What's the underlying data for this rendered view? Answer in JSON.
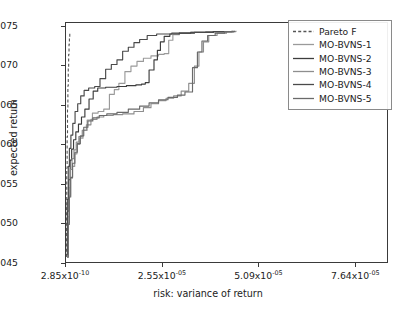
{
  "chart_data": {
    "type": "line",
    "title": "",
    "xlabel": "risk: variance of return",
    "ylabel": "expected return",
    "xlim": [
      0,
      8.5e-05
    ],
    "ylim": [
      0.045,
      0.0755
    ],
    "grid": false,
    "legend_position": "upper right",
    "xticks": [
      {
        "value": 2.85e-10,
        "mantissa": "2.85x10",
        "exponent": "-10",
        "label": "2.85x10-10"
      },
      {
        "value": 2.55e-05,
        "mantissa": "2.55x10",
        "exponent": "-05",
        "label": "2.55x10-05"
      },
      {
        "value": 5.09e-05,
        "mantissa": "5.09x10",
        "exponent": "-05",
        "label": "5.09x10-05"
      },
      {
        "value": 7.64e-05,
        "mantissa": "7.64x10",
        "exponent": "-05",
        "label": "7.64x10-05"
      }
    ],
    "yticks": [
      {
        "value": 0.045,
        "label": "0.045"
      },
      {
        "value": 0.05,
        "label": "0.050"
      },
      {
        "value": 0.055,
        "label": "0.055"
      },
      {
        "value": 0.06,
        "label": "0.060"
      },
      {
        "value": 0.065,
        "label": "0.065"
      },
      {
        "value": 0.07,
        "label": "0.070"
      },
      {
        "value": 0.075,
        "label": "0.075"
      }
    ],
    "series": [
      {
        "name": "Pareto F",
        "color": "#555555",
        "style": "dashed",
        "width": 1.1,
        "points": [
          [
            0.0,
            0.0457
          ],
          [
            1e-07,
            0.052
          ],
          [
            2e-07,
            0.057
          ],
          [
            3e-07,
            0.061
          ],
          [
            4e-07,
            0.0645
          ],
          [
            5e-07,
            0.0675
          ],
          [
            6e-07,
            0.0698
          ],
          [
            7e-07,
            0.0715
          ],
          [
            8e-07,
            0.0728
          ],
          [
            9e-07,
            0.0737
          ],
          [
            1e-06,
            0.0742
          ]
        ]
      },
      {
        "name": "MO-BVNS-1",
        "color": "#9a9a9a",
        "style": "solid",
        "width": 1.15,
        "points": [
          [
            3e-07,
            0.0456
          ],
          [
            6e-07,
            0.05
          ],
          [
            9e-07,
            0.0535
          ],
          [
            1.2e-06,
            0.0557
          ],
          [
            1.7e-06,
            0.0572
          ],
          [
            2.3e-06,
            0.0588
          ],
          [
            2.9e-06,
            0.06
          ],
          [
            3.6e-06,
            0.0608
          ],
          [
            4.5e-06,
            0.0618
          ],
          [
            5.6e-06,
            0.0631
          ],
          [
            7e-06,
            0.064
          ],
          [
            8.5e-06,
            0.0642
          ],
          [
            1e-05,
            0.0645
          ],
          [
            1.15e-05,
            0.0664
          ],
          [
            1.28e-05,
            0.067
          ],
          [
            1.4e-05,
            0.0678
          ],
          [
            1.56e-05,
            0.0693
          ],
          [
            1.72e-05,
            0.07
          ],
          [
            1.88e-05,
            0.0706
          ],
          [
            2.05e-05,
            0.071
          ],
          [
            2.25e-05,
            0.0713
          ],
          [
            2.45e-05,
            0.0715
          ],
          [
            2.6e-05,
            0.0716
          ],
          [
            2.72e-05,
            0.0733
          ],
          [
            2.83e-05,
            0.074
          ],
          [
            3e-05,
            0.0742
          ],
          [
            3.3e-05,
            0.0743
          ],
          [
            3.7e-05,
            0.0744
          ],
          [
            4.1e-05,
            0.0744
          ],
          [
            4.4e-05,
            0.0745
          ]
        ]
      },
      {
        "name": "MO-BVNS-2",
        "color": "#3d3d3d",
        "style": "solid",
        "width": 1.15,
        "points": [
          [
            2e-07,
            0.0459
          ],
          [
            4.5e-07,
            0.0515
          ],
          [
            7.5e-07,
            0.0555
          ],
          [
            1.1e-06,
            0.058
          ],
          [
            1.5e-06,
            0.0594
          ],
          [
            2e-06,
            0.0606
          ],
          [
            2.6e-06,
            0.0616
          ],
          [
            3.3e-06,
            0.0626
          ],
          [
            4.1e-06,
            0.0635
          ],
          [
            5e-06,
            0.0645
          ],
          [
            6.1e-06,
            0.0658
          ],
          [
            7.2e-06,
            0.0668
          ],
          [
            8.4e-06,
            0.0672
          ],
          [
            1.05e-05,
            0.0673
          ],
          [
            1.35e-05,
            0.0674
          ],
          [
            1.6e-05,
            0.0675
          ],
          [
            1.85e-05,
            0.0676
          ],
          [
            2e-05,
            0.0677
          ],
          [
            2.1e-05,
            0.0679
          ],
          [
            2.2e-05,
            0.0695
          ],
          [
            2.33e-05,
            0.0708
          ],
          [
            2.42e-05,
            0.072
          ],
          [
            2.5e-05,
            0.0731
          ],
          [
            2.6e-05,
            0.0738
          ],
          [
            2.75e-05,
            0.0741
          ],
          [
            3e-05,
            0.0742
          ],
          [
            3.4e-05,
            0.0743
          ],
          [
            3.9e-05,
            0.0744
          ],
          [
            4.4e-05,
            0.0745
          ]
        ]
      },
      {
        "name": "MO-BVNS-3",
        "color": "#8e8e8e",
        "style": "solid",
        "width": 1.15,
        "points": [
          [
            2.5e-07,
            0.0457
          ],
          [
            5.5e-07,
            0.0508
          ],
          [
            8.5e-07,
            0.0545
          ],
          [
            1.15e-06,
            0.0568
          ],
          [
            1.6e-06,
            0.0582
          ],
          [
            2.1e-06,
            0.0593
          ],
          [
            2.7e-06,
            0.0603
          ],
          [
            3.4e-06,
            0.061
          ],
          [
            4.3e-06,
            0.0618
          ],
          [
            5.4e-06,
            0.0625
          ],
          [
            6.6e-06,
            0.0632
          ],
          [
            8.2e-06,
            0.0635
          ],
          [
            1e-05,
            0.0637
          ],
          [
            1.25e-05,
            0.0638
          ],
          [
            1.5e-05,
            0.0639
          ],
          [
            1.8e-05,
            0.0642
          ],
          [
            2.05e-05,
            0.0647
          ],
          [
            2.25e-05,
            0.0652
          ],
          [
            2.45e-05,
            0.0656
          ],
          [
            2.65e-05,
            0.0659
          ],
          [
            2.85e-05,
            0.0662
          ],
          [
            3.05e-05,
            0.0668
          ],
          [
            3.25e-05,
            0.0678
          ],
          [
            3.4e-05,
            0.07
          ],
          [
            3.52e-05,
            0.0718
          ],
          [
            3.64e-05,
            0.0731
          ],
          [
            3.78e-05,
            0.0739
          ],
          [
            4e-05,
            0.0742
          ],
          [
            4.25e-05,
            0.0744
          ],
          [
            4.5e-05,
            0.0745
          ]
        ]
      },
      {
        "name": "MO-BVNS-4",
        "color": "#4a4a4a",
        "style": "solid",
        "width": 1.15,
        "points": [
          [
            1.5e-07,
            0.046
          ],
          [
            3.5e-07,
            0.053
          ],
          [
            6e-07,
            0.0572
          ],
          [
            9e-07,
            0.0595
          ],
          [
            1.3e-06,
            0.0612
          ],
          [
            1.8e-06,
            0.0627
          ],
          [
            2.4e-06,
            0.0642
          ],
          [
            3.1e-06,
            0.0652
          ],
          [
            3.9e-06,
            0.0662
          ],
          [
            4.8e-06,
            0.0669
          ],
          [
            6e-06,
            0.0672
          ],
          [
            7.6e-06,
            0.0674
          ],
          [
            9e-06,
            0.0684
          ],
          [
            1.05e-05,
            0.0696
          ],
          [
            1.2e-05,
            0.0702
          ],
          [
            1.35e-05,
            0.0708
          ],
          [
            1.5e-05,
            0.0719
          ],
          [
            1.65e-05,
            0.0724
          ],
          [
            1.8e-05,
            0.073
          ],
          [
            1.95e-05,
            0.0734
          ],
          [
            2.15e-05,
            0.0739
          ],
          [
            2.4e-05,
            0.0741
          ],
          [
            2.8e-05,
            0.0742
          ],
          [
            3.3e-05,
            0.0743
          ],
          [
            3.9e-05,
            0.0744
          ],
          [
            4.45e-05,
            0.0745
          ]
        ]
      },
      {
        "name": "MO-BVNS-5",
        "color": "#6a6a6a",
        "style": "solid",
        "width": 1.15,
        "points": [
          [
            2.8e-07,
            0.0456
          ],
          [
            5.8e-07,
            0.0498
          ],
          [
            8.8e-07,
            0.0533
          ],
          [
            1.25e-06,
            0.0558
          ],
          [
            1.75e-06,
            0.0576
          ],
          [
            2.35e-06,
            0.059
          ],
          [
            3e-06,
            0.0601
          ],
          [
            3.8e-06,
            0.0611
          ],
          [
            4.7e-06,
            0.0622
          ],
          [
            5.8e-06,
            0.063
          ],
          [
            7.1e-06,
            0.0634
          ],
          [
            8.8e-06,
            0.0637
          ],
          [
            1.08e-05,
            0.0639
          ],
          [
            1.35e-05,
            0.0641
          ],
          [
            1.65e-05,
            0.0645
          ],
          [
            1.95e-05,
            0.0649
          ],
          [
            2.2e-05,
            0.0653
          ],
          [
            2.45e-05,
            0.0657
          ],
          [
            2.7e-05,
            0.066
          ],
          [
            2.95e-05,
            0.0663
          ],
          [
            3.15e-05,
            0.0667
          ],
          [
            3.35e-05,
            0.0698
          ],
          [
            3.48e-05,
            0.0718
          ],
          [
            3.6e-05,
            0.0732
          ],
          [
            3.75e-05,
            0.0739
          ],
          [
            3.95e-05,
            0.0742
          ],
          [
            4.2e-05,
            0.0744
          ],
          [
            4.45e-05,
            0.0745
          ]
        ]
      }
    ]
  }
}
